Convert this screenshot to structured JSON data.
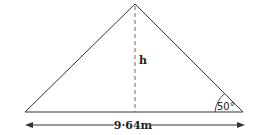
{
  "diagram": {
    "type": "triangle",
    "height_label": "h",
    "angle_label": "50°",
    "base_label": "9·64m",
    "colors": {
      "stroke": "#333333",
      "background": "#ffffff"
    }
  }
}
